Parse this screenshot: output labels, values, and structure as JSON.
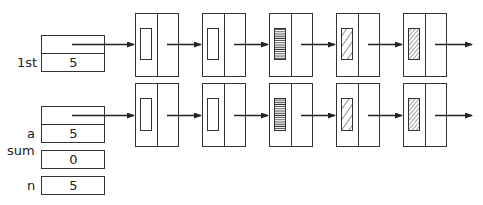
{
  "variables": {
    "lst": {
      "label": "1st",
      "value": "5"
    },
    "a": {
      "label": "a",
      "value": "5"
    },
    "sum": {
      "label": "sum",
      "value": "0"
    },
    "n": {
      "label": "n",
      "value": "5"
    }
  },
  "lists": [
    {
      "name": "lst-list",
      "nodes": [
        {
          "fill": "empty"
        },
        {
          "fill": "empty"
        },
        {
          "fill": "horizontal-lines"
        },
        {
          "fill": "diagonal-wide"
        },
        {
          "fill": "diagonal-dense"
        }
      ]
    },
    {
      "name": "a-list",
      "nodes": [
        {
          "fill": "empty"
        },
        {
          "fill": "empty"
        },
        {
          "fill": "horizontal-lines"
        },
        {
          "fill": "diagonal-wide"
        },
        {
          "fill": "diagonal-dense"
        }
      ]
    }
  ],
  "colors": {
    "stroke": "#333333",
    "background": "#ffffff"
  }
}
